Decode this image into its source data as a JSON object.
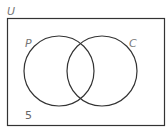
{
  "diagram": {
    "type": "venn",
    "universal_label": "U",
    "sets": [
      {
        "label": "P"
      },
      {
        "label": "C"
      }
    ],
    "outside_value": "5",
    "colors": {
      "stroke": "#333333",
      "label": "#777777"
    }
  }
}
